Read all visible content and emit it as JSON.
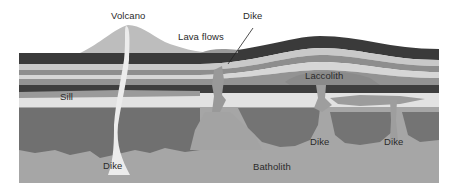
{
  "diagram": {
    "labels": {
      "volcano": "Volcano",
      "lava_flows": "Lava flows",
      "dike_top": "Dike",
      "laccolith": "Laccolith",
      "sill": "Sill",
      "dike_left": "Dike",
      "batholith": "Batholith",
      "dike_mid": "Dike",
      "dike_right": "Dike"
    },
    "colors": {
      "background": "#ffffff",
      "dark_layer": "#3a3a3a",
      "mid_layer": "#8c8c8c",
      "light_layer": "#cfcfcf",
      "pale_layer": "#e4e4e4",
      "lower_dark": "#6e6e6e",
      "batholith": "#a3a3a3",
      "volcano": "#b8b8b8",
      "magma_conduit": "#ededed"
    }
  }
}
